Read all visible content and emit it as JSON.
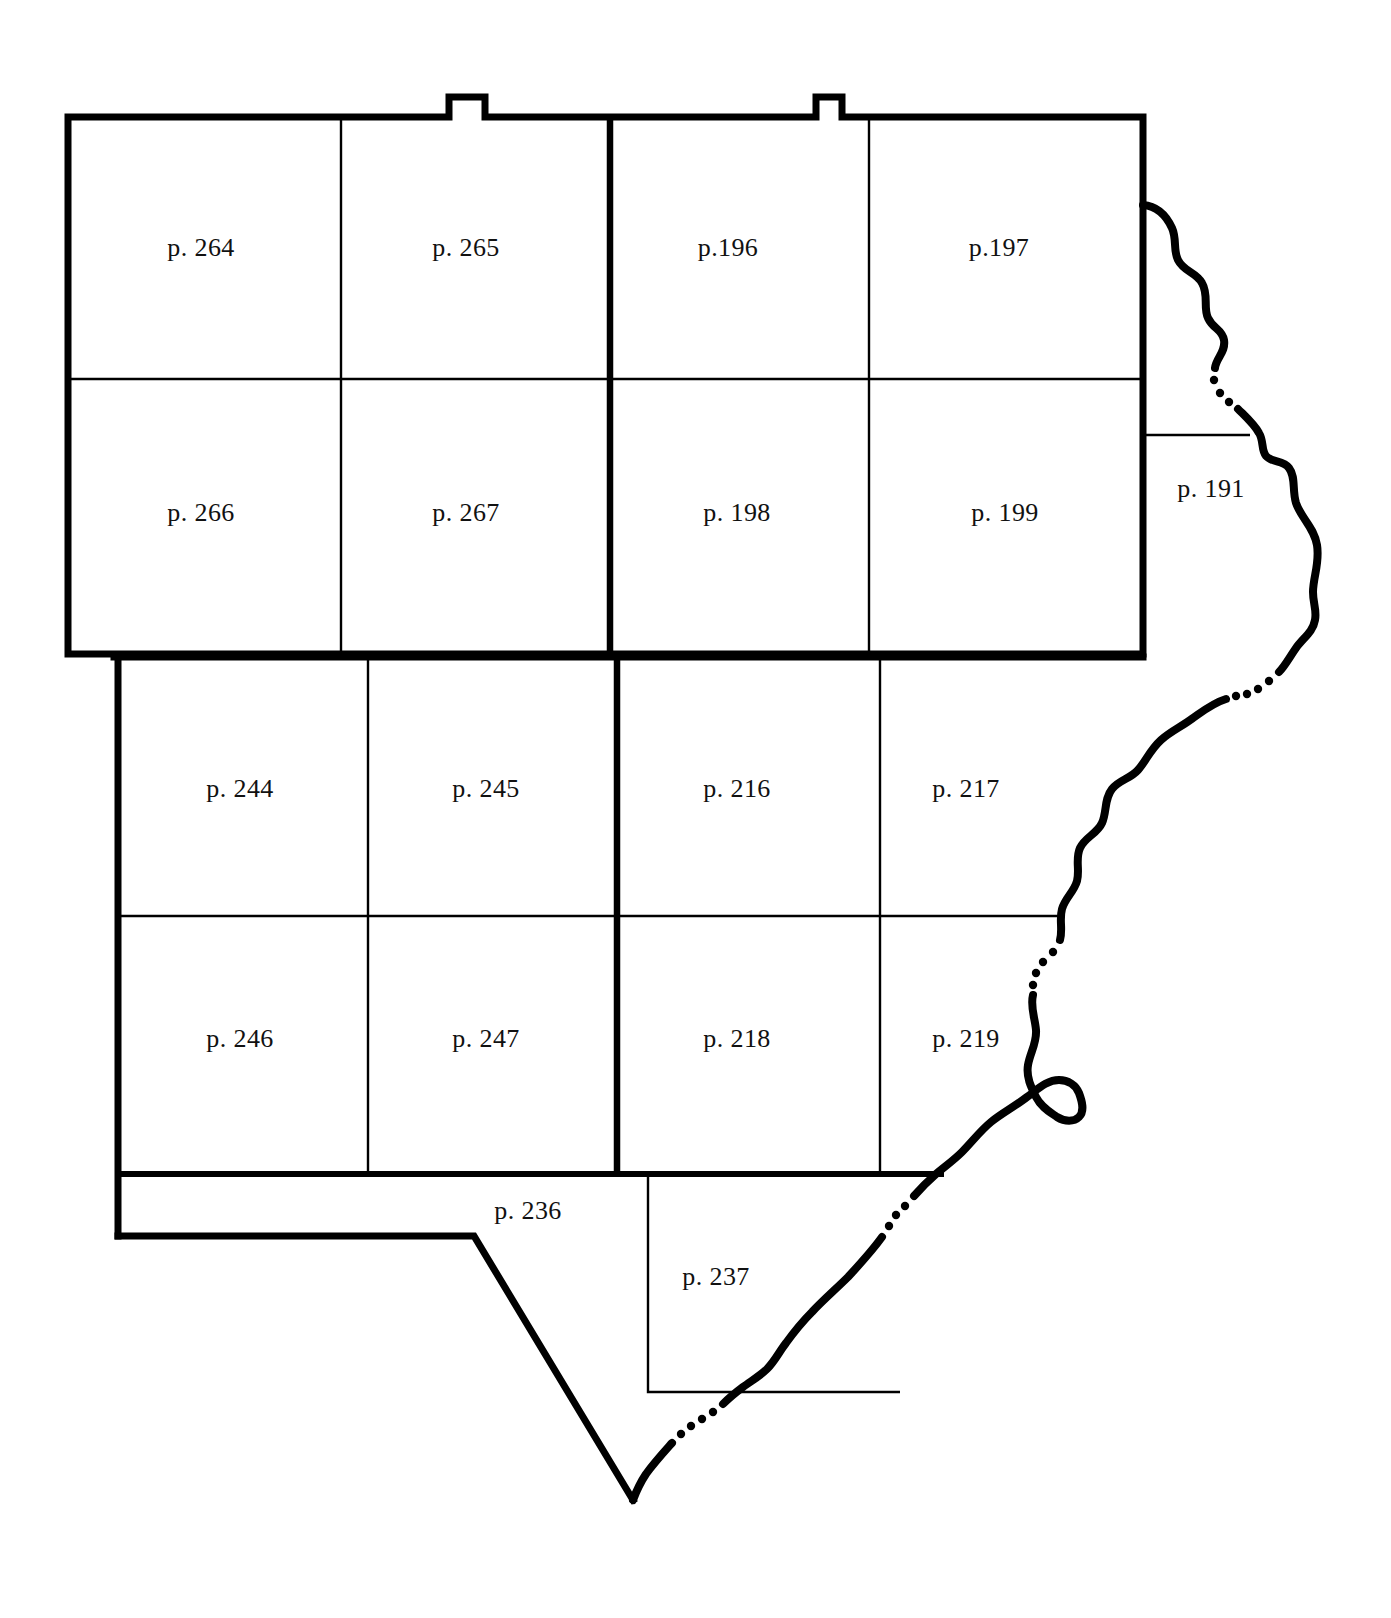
{
  "map": {
    "title": "Township index map",
    "background_color": "#ffffff",
    "line_color": "#000000",
    "heavy_line_width": 7,
    "thin_line_width": 2.2,
    "river_line_width": 8,
    "labels": [
      {
        "id": "p-264",
        "text": "p. 264",
        "x": 201,
        "y": 248
      },
      {
        "id": "p-265",
        "text": "p. 265",
        "x": 466,
        "y": 248
      },
      {
        "id": "p-196",
        "text": "p.196",
        "x": 728,
        "y": 248
      },
      {
        "id": "p-197",
        "text": "p.197",
        "x": 999,
        "y": 248
      },
      {
        "id": "p-266",
        "text": "p. 266",
        "x": 201,
        "y": 513
      },
      {
        "id": "p-267",
        "text": "p. 267",
        "x": 466,
        "y": 513
      },
      {
        "id": "p-198",
        "text": "p. 198",
        "x": 737,
        "y": 513
      },
      {
        "id": "p-199",
        "text": "p. 199",
        "x": 1005,
        "y": 513
      },
      {
        "id": "p-191",
        "text": "p. 191",
        "x": 1211,
        "y": 489
      },
      {
        "id": "p-244",
        "text": "p. 244",
        "x": 240,
        "y": 789
      },
      {
        "id": "p-245",
        "text": "p. 245",
        "x": 486,
        "y": 789
      },
      {
        "id": "p-216",
        "text": "p. 216",
        "x": 737,
        "y": 789
      },
      {
        "id": "p-217",
        "text": "p. 217",
        "x": 966,
        "y": 789
      },
      {
        "id": "p-246",
        "text": "p. 246",
        "x": 240,
        "y": 1039
      },
      {
        "id": "p-247",
        "text": "p. 247",
        "x": 486,
        "y": 1039
      },
      {
        "id": "p-218",
        "text": "p. 218",
        "x": 737,
        "y": 1039
      },
      {
        "id": "p-219",
        "text": "p. 219",
        "x": 966,
        "y": 1039
      },
      {
        "id": "p-236",
        "text": "p. 236",
        "x": 528,
        "y": 1211
      },
      {
        "id": "p-237",
        "text": "p. 237",
        "x": 716,
        "y": 1277
      }
    ],
    "geometry": {
      "upper_block": {
        "left": 68,
        "right": 1143,
        "top": 117,
        "bottom": 654,
        "vertical_thin": [
          341,
          869
        ],
        "vertical_heavy": [
          610
        ],
        "horizontal_thin": [
          379
        ]
      },
      "lower_block": {
        "left": 118,
        "right": 1143,
        "top": 660,
        "bottom": 1172,
        "bottom_end_x": 940,
        "vertical_thin": [
          368,
          880
        ],
        "vertical_heavy": [
          617
        ],
        "horizontal_thin": [
          916
        ]
      },
      "tail_block": {
        "strip_left": 118,
        "strip_top": 1177,
        "strip_bottom": 1236,
        "strip_diag_start_x": 474,
        "apex_x": 633,
        "apex_y": 1500,
        "p237_left": 648,
        "p237_bottom": 1392,
        "p237_right": 900
      },
      "p191_block": {
        "left": 1143,
        "top": 435,
        "bottom": 660
      },
      "notches": [
        {
          "x": 449,
          "width": 36,
          "height": 20
        },
        {
          "x": 816,
          "width": 26,
          "height": 20
        }
      ]
    }
  }
}
